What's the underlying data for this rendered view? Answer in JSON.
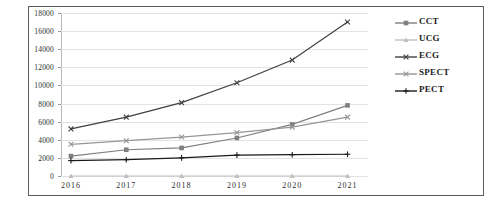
{
  "chart_data": {
    "type": "line",
    "title": "",
    "xlabel": "",
    "ylabel": "",
    "categories": [
      "2016",
      "2017",
      "2018",
      "2019",
      "2020",
      "2021"
    ],
    "ylim": [
      0,
      18000
    ],
    "ytick_step": 2000,
    "yticks": [
      "0",
      "2000",
      "4000",
      "6000",
      "8000",
      "10000",
      "12000",
      "14000",
      "16000",
      "18000"
    ],
    "grid": true,
    "legend_position": "right",
    "series": [
      {
        "name": "CCT",
        "color": "#7f7f7f",
        "marker": "square",
        "values": [
          2200,
          2900,
          3100,
          4200,
          5700,
          7800
        ]
      },
      {
        "name": "UCG",
        "color": "#bfbfbf",
        "marker": "triangle",
        "values": [
          0,
          0,
          0,
          0,
          0,
          0
        ]
      },
      {
        "name": "ECG",
        "color": "#404040",
        "marker": "x",
        "values": [
          5200,
          6500,
          8100,
          10300,
          12800,
          17000
        ]
      },
      {
        "name": "SPECT",
        "color": "#969696",
        "marker": "x",
        "values": [
          3500,
          3900,
          4300,
          4800,
          5400,
          6500
        ]
      },
      {
        "name": "PECT",
        "color": "#1a1a1a",
        "marker": "plus",
        "values": [
          1700,
          1800,
          2000,
          2300,
          2350,
          2400
        ]
      }
    ]
  },
  "legend": {
    "items": [
      {
        "label": "CCT"
      },
      {
        "label": "UCG"
      },
      {
        "label": "ECG"
      },
      {
        "label": "SPECT"
      },
      {
        "label": "PECT"
      }
    ]
  }
}
